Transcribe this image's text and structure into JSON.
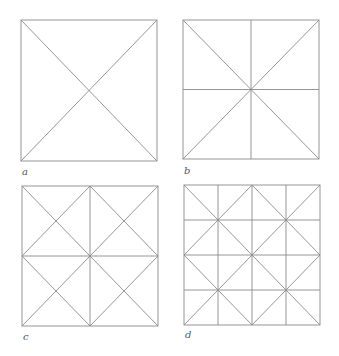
{
  "line_color": "#8a8a8a",
  "panels": [
    {
      "label": "a",
      "box": [
        21,
        20,
        157,
        161
      ],
      "grid": 1,
      "pattern": "diagonals"
    },
    {
      "label": "b",
      "box": [
        183,
        20,
        319,
        159
      ],
      "grid": 2,
      "pattern": "midlines-and-diagonals"
    },
    {
      "label": "c",
      "box": [
        22,
        186,
        158,
        326
      ],
      "grid": 2,
      "pattern": "quadrant-crosses-with-diamond"
    },
    {
      "label": "d",
      "box": [
        184,
        185,
        320,
        325
      ],
      "grid": 4,
      "pattern": "4x4-grid-with-quadrant-crosses"
    }
  ]
}
